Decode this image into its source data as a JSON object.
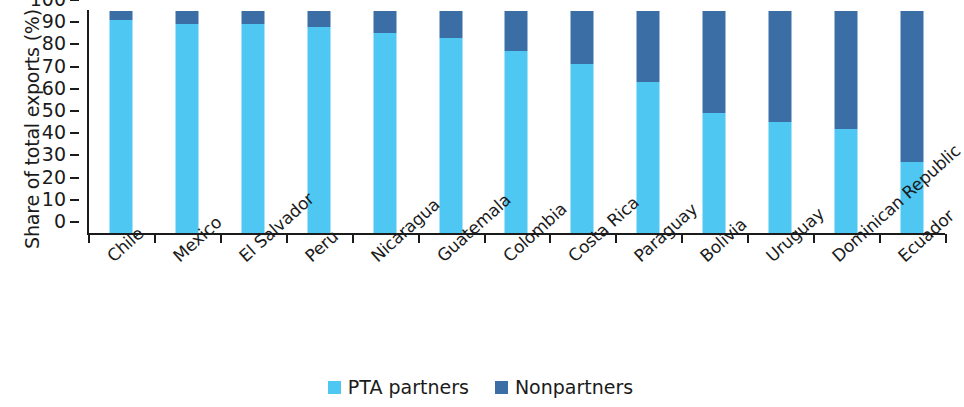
{
  "chart_data": {
    "type": "bar",
    "subtype": "stacked-percentage",
    "title": "",
    "xlabel": "",
    "ylabel": "Share of total exports (%)",
    "ylim": [
      0,
      100
    ],
    "yticks": [
      100,
      90,
      80,
      70,
      60,
      50,
      40,
      30,
      20,
      10,
      0
    ],
    "grid": false,
    "legend_position": "bottom-center",
    "categories": [
      "Chile",
      "Mexico",
      "El Salvador",
      "Peru",
      "Nicaragua",
      "Guatemala",
      "Colombia",
      "Costa Rica",
      "Paraguay",
      "Bolivia",
      "Uruguay",
      "Dominican Republic",
      "Ecuador"
    ],
    "series": [
      {
        "name": "PTA partners",
        "color": "#4ec8f2",
        "values": [
          96,
          94,
          94,
          93,
          90,
          88,
          82,
          76,
          68,
          54,
          50,
          47,
          32
        ]
      },
      {
        "name": "Nonpartners",
        "color": "#3c6ea6",
        "values": [
          4,
          6,
          6,
          7,
          10,
          12,
          18,
          24,
          32,
          46,
          50,
          53,
          68
        ]
      }
    ]
  },
  "legend": {
    "items": [
      {
        "label": "PTA partners",
        "color": "#4ec8f2",
        "swatch_name": "legend-swatch-pta-partners"
      },
      {
        "label": "Nonpartners",
        "color": "#3c6ea6",
        "swatch_name": "legend-swatch-nonpartners"
      }
    ]
  }
}
